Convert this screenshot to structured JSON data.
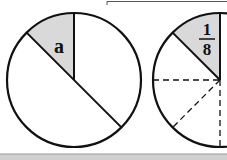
{
  "diagram": {
    "left_circle": {
      "label": "a",
      "shaded_sector_degrees": 45,
      "fill_color": "#d9d9d9"
    },
    "right_circle": {
      "label_numerator": "1",
      "label_denominator": "8",
      "shaded_sector_degrees": 45,
      "fill_color": "#d9d9d9",
      "dashed_divisions": true
    },
    "stroke_color": "#111111",
    "bottom_band_color": "#d0d0d0"
  }
}
